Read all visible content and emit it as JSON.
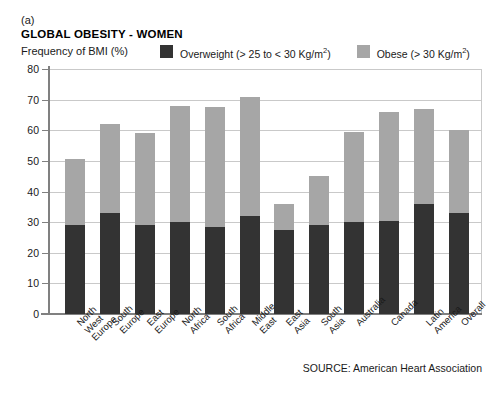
{
  "figure": {
    "panel_letter": "(a)",
    "title": "GLOBAL OBESITY - WOMEN",
    "y_axis_label": "Frequency of BMI (%)",
    "source": "SOURCE: American Heart Association"
  },
  "legend": {
    "items": [
      {
        "label_main": "Overweight (> 25 to < 30 Kg/m",
        "sup": "2",
        "label_end": ")",
        "color": "#333333",
        "name": "overweight"
      },
      {
        "label_main": "Obese (> 30 Kg/m",
        "sup": "2",
        "label_end": ")",
        "color": "#a6a6a6",
        "name": "obese"
      }
    ]
  },
  "colors": {
    "overweight": "#333333",
    "obese": "#a6a6a6",
    "axis": "#808080",
    "grid": "#c9c9c9",
    "background": "#ffffff"
  },
  "chart_data": {
    "type": "bar",
    "subtype": "stacked",
    "title": "GLOBAL OBESITY - WOMEN",
    "xlabel": "",
    "ylabel": "Frequency of BMI (%)",
    "ylim": [
      0,
      80
    ],
    "yticks": [
      0,
      10,
      20,
      30,
      40,
      50,
      60,
      70,
      80
    ],
    "grid": true,
    "legend_position": "top",
    "categories": [
      "North West Europe",
      "South Europe",
      "East Europe",
      "North Africa",
      "South Africa",
      "Middle East",
      "East Asia",
      "South Asia",
      "Australia",
      "Canada",
      "Latin America",
      "Overall"
    ],
    "series": [
      {
        "name": "Overweight (> 25 to < 30 Kg/m2)",
        "color": "#333333",
        "values": [
          29,
          33,
          29,
          30,
          28.5,
          32,
          27.5,
          29,
          30,
          30.5,
          36,
          33
        ]
      },
      {
        "name": "Obese (> 30 Kg/m2)",
        "color": "#a6a6a6",
        "values": [
          21.5,
          29,
          30,
          38,
          39,
          39,
          8.5,
          16,
          29.5,
          35.5,
          31,
          27
        ]
      }
    ],
    "totals": [
      50.5,
      62,
      59,
      68,
      67.5,
      71,
      36,
      45,
      59.5,
      66,
      67,
      60
    ]
  }
}
